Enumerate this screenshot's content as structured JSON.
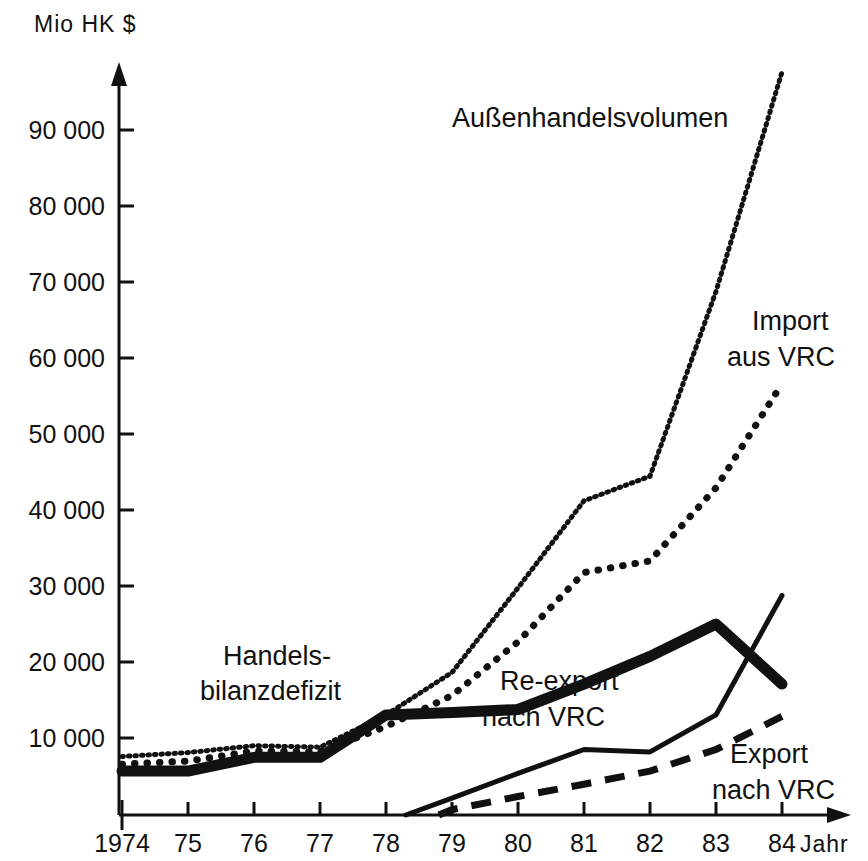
{
  "chart_data": {
    "type": "line",
    "title": "",
    "xlabel": "Jahr",
    "ylabel": "Mio HK $",
    "x": [
      1974,
      1975,
      1976,
      1977,
      1978,
      1979,
      1980,
      1981,
      1982,
      1983,
      1984
    ],
    "categories": [
      "1974",
      "75",
      "76",
      "77",
      "78",
      "79",
      "80",
      "81",
      "82",
      "83",
      "84"
    ],
    "xlim": [
      1974,
      1984
    ],
    "ylim": [
      0,
      97000
    ],
    "yticks": [
      10000,
      20000,
      30000,
      40000,
      50000,
      60000,
      70000,
      80000,
      90000
    ],
    "ytick_labels": [
      "10 000",
      "20 000",
      "30 000",
      "40 000",
      "50 000",
      "60 000",
      "70 000",
      "80 000",
      "90 000"
    ],
    "grid": false,
    "legend": "inline-annotations",
    "series": [
      {
        "name": "Außenhandelsvolumen",
        "style": "fine-dotted",
        "x": [
          1974,
          1975,
          1976,
          1977,
          1978,
          1979,
          1980,
          1981,
          1982,
          1983,
          1984
        ],
        "values": [
          7600,
          8100,
          9000,
          8800,
          13000,
          18500,
          29500,
          40800,
          44000,
          68000,
          96500
        ]
      },
      {
        "name": "Import aus VRC",
        "style": "coarse-dotted",
        "x": [
          1974,
          1975,
          1976,
          1977,
          1978,
          1979,
          1980,
          1981,
          1982,
          1983,
          1984
        ],
        "values": [
          6600,
          7000,
          8300,
          8200,
          11500,
          15500,
          22500,
          31500,
          33000,
          42500,
          56000
        ]
      },
      {
        "name": "Handelsbilanzdefizit",
        "style": "thick-solid",
        "x": [
          1974,
          1975,
          1976,
          1977,
          1978,
          1979,
          1980,
          1981,
          1982,
          1983,
          1984
        ],
        "values": [
          5700,
          5700,
          7500,
          7500,
          13000,
          13300,
          13700,
          17000,
          20600,
          24800,
          17000
        ]
      },
      {
        "name": "Re-export nach VRC",
        "style": "thin-solid",
        "x": [
          1978.3,
          1979,
          1980,
          1981,
          1982,
          1983,
          1984
        ],
        "values": [
          0,
          2200,
          5400,
          8500,
          8200,
          13000,
          28500
        ]
      },
      {
        "name": "Export nach VRC",
        "style": "dashed",
        "x": [
          1978.8,
          1979,
          1980,
          1981,
          1982,
          1983,
          1984
        ],
        "values": [
          0,
          700,
          2400,
          4000,
          5700,
          8500,
          12800
        ]
      }
    ],
    "annotations": [
      {
        "id": "annotation-aussenhandelsvolumen",
        "text": "Außenhandelsvolumen",
        "lines": [
          "Außenhandelsvolumen"
        ]
      },
      {
        "id": "annotation-import",
        "text": "Import aus VRC",
        "lines": [
          "Import",
          "aus VRC"
        ]
      },
      {
        "id": "annotation-handelsbilanzdefizit",
        "text": "Handelsbilanzdefizit",
        "lines": [
          "Handels-",
          "bilanzdefizit"
        ]
      },
      {
        "id": "annotation-reexport",
        "text": "Re-export nach VRC",
        "lines": [
          "Re-export",
          "nach VRC"
        ]
      },
      {
        "id": "annotation-export",
        "text": "Export nach VRC",
        "lines": [
          "Export",
          "nach VRC"
        ]
      }
    ]
  },
  "axes": {
    "y_axis_title": "Mio HK $",
    "x_axis_title": "Jahr",
    "y_tick_labels": [
      "90 000",
      "80 000",
      "70 000",
      "60 000",
      "50 000",
      "40 000",
      "30 000",
      "20 000",
      "10 000"
    ],
    "x_tick_labels": [
      "1974",
      "75",
      "76",
      "77",
      "78",
      "79",
      "80",
      "81",
      "82",
      "83",
      "84"
    ]
  },
  "annotations": {
    "aussenhandelsvolumen": "Außenhandelsvolumen",
    "import_line1": "Import",
    "import_line2": "aus VRC",
    "handels_line1": "Handels-",
    "handels_line2": "bilanzdefizit",
    "reexport_line1": "Re-export",
    "reexport_line2": "nach VRC",
    "export_line1": "Export",
    "export_line2": "nach VRC"
  },
  "colors": {
    "ink": "#111111",
    "background": "#ffffff"
  }
}
